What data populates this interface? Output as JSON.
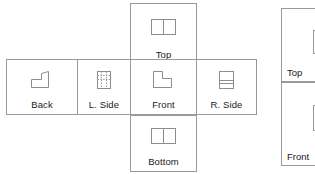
{
  "diagram": {
    "type": "orthographic-projection-layout",
    "title_visible": false,
    "stroke_color": "#9a9a9a",
    "text_color": "#1b1b1b",
    "background_color": "#ffffff"
  },
  "views": {
    "top": {
      "label": "Top",
      "icon": "rect-split-vertical-icon",
      "position": "above-front"
    },
    "back": {
      "label": "Back",
      "icon": "stepped-profile-right-icon",
      "position": "row-left"
    },
    "left_side": {
      "label": "L. Side",
      "icon": "rect-hidden-lines-icon",
      "position": "row-second"
    },
    "front": {
      "label": "Front",
      "icon": "stepped-profile-notch-icon",
      "position": "row-center"
    },
    "right_side": {
      "label": "R. Side",
      "icon": "rect-split-horizontal-icon",
      "position": "row-right"
    },
    "bottom": {
      "label": "Bottom",
      "icon": "rect-split-vertical-icon",
      "position": "below-front"
    }
  },
  "side_panel": {
    "cropped": true,
    "cells": [
      {
        "label": "Top",
        "icon": "rect-outline-icon"
      },
      {
        "label": "Front",
        "icon": "rect-outline-icon"
      }
    ]
  }
}
